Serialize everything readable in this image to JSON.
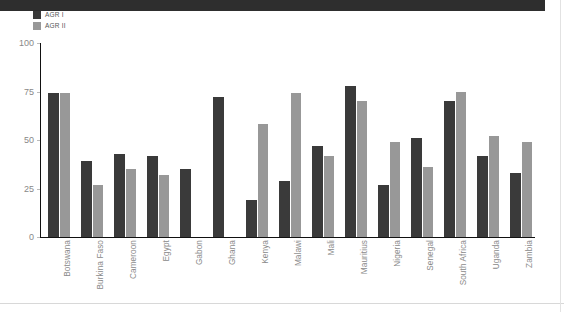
{
  "banner": {
    "present": true,
    "color": "#2e2e2e"
  },
  "legend": {
    "items": [
      {
        "label": "AGR I",
        "color": "#3a3a3a"
      },
      {
        "label": "AGR II",
        "color": "#989898"
      }
    ]
  },
  "axis": {
    "y_ticks": [
      "0",
      "25",
      "50",
      "75",
      "100"
    ],
    "y_min": 0,
    "y_max": 100
  },
  "chart_data": {
    "type": "bar",
    "title": "",
    "subtitle": "",
    "xlabel": "",
    "ylabel": "",
    "ylim": [
      0,
      100
    ],
    "yticks": [
      0,
      25,
      50,
      75,
      100
    ],
    "grid": false,
    "legend_position": "top-left",
    "categories": [
      "Botswana",
      "Burkina Faso",
      "Cameroon",
      "Egypt",
      "Gabon",
      "Ghana",
      "Kenya",
      "Malawi",
      "Mali",
      "Mauritius",
      "Nigeria",
      "Senegal",
      "South Africa",
      "Uganda",
      "Zambia"
    ],
    "series": [
      {
        "name": "AGR I",
        "color": "#3a3a3a",
        "values": [
          74,
          39,
          43,
          42,
          35,
          72,
          19,
          29,
          47,
          78,
          27,
          51,
          70,
          42,
          33
        ]
      },
      {
        "name": "AGR II",
        "color": "#989898",
        "values": [
          74,
          27,
          35,
          32,
          null,
          null,
          58,
          74,
          42,
          70,
          49,
          36,
          75,
          52,
          49
        ]
      }
    ]
  }
}
